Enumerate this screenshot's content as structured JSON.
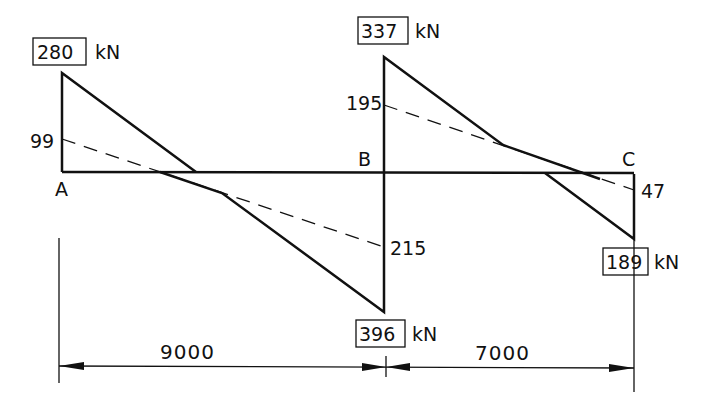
{
  "diagram": {
    "type": "shear-force-diagram",
    "unit": "kN",
    "supports": {
      "A": "A",
      "B": "B",
      "C": "C"
    },
    "boxed_values": {
      "A_top": "280",
      "B_top": "337",
      "B_bottom": "396",
      "C_bottom": "189"
    },
    "intermediate_values": {
      "A_dashed": "99",
      "B_dashed_top": "195",
      "B_dashed_bottom": "215",
      "C_dashed": "47"
    },
    "spans": {
      "AB": "9000",
      "BC": "7000"
    },
    "colors": {
      "line": "#111111",
      "background": "#ffffff"
    }
  }
}
